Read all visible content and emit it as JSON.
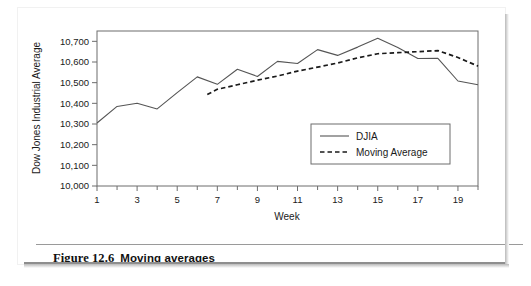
{
  "figure": {
    "caption_label": "Figure 12.6",
    "caption_title": "Moving averages"
  },
  "chart_data": {
    "type": "line",
    "title": "",
    "xlabel": "Week",
    "ylabel": "Dow Jones Industrial Average",
    "xlim": [
      1,
      20
    ],
    "ylim": [
      10000,
      10750
    ],
    "ytick_labels": [
      "10,000",
      "10,100",
      "10,200",
      "10,300",
      "10,400",
      "10,500",
      "10,600",
      "10,700"
    ],
    "ytick_values": [
      10000,
      10100,
      10200,
      10300,
      10400,
      10500,
      10600,
      10700
    ],
    "xtick_labels": [
      "1",
      "3",
      "5",
      "7",
      "9",
      "11",
      "13",
      "15",
      "17",
      "19"
    ],
    "xtick_values": [
      1,
      3,
      5,
      7,
      9,
      11,
      13,
      15,
      17,
      19
    ],
    "x_minor_ticks": [
      1,
      2,
      3,
      4,
      5,
      6,
      7,
      8,
      9,
      10,
      11,
      12,
      13,
      14,
      15,
      16,
      17,
      18,
      19,
      20
    ],
    "grid": false,
    "legend_position": "inside-lower-right",
    "x": [
      1,
      2,
      3,
      4,
      5,
      6,
      7,
      8,
      9,
      10,
      11,
      12,
      13,
      14,
      15,
      16,
      17,
      18,
      19,
      20
    ],
    "series": [
      {
        "name": "DJIA",
        "style": "solid",
        "color": "#555555",
        "values": [
          10305,
          10385,
          10400,
          10373,
          10452,
          10528,
          10492,
          10565,
          10530,
          10603,
          10593,
          10660,
          10632,
          10672,
          10715,
          10670,
          10617,
          10618,
          10508,
          10490
        ]
      },
      {
        "name": "Moving Average",
        "style": "dashed",
        "color": "#1a1a1a",
        "start_x": 6.5,
        "values": [
          null,
          null,
          null,
          null,
          null,
          10443,
          10468,
          10490,
          10512,
          10532,
          10556,
          10575,
          10595,
          10620,
          10640,
          10645,
          10650,
          10655,
          10622,
          10580
        ]
      }
    ]
  },
  "legend": {
    "items": [
      {
        "label": "DJIA",
        "style": "solid"
      },
      {
        "label": "Moving Average",
        "style": "dashed"
      }
    ]
  }
}
